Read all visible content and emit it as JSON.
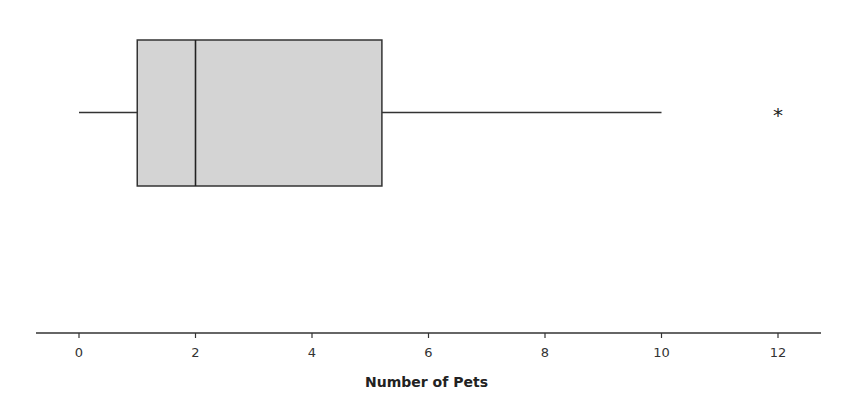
{
  "chart_data": {
    "type": "boxplot",
    "title": "",
    "xlabel": "Number of Pets",
    "ylabel": "",
    "xlim": [
      -0.75,
      12.75
    ],
    "ticks": [
      0,
      2,
      4,
      6,
      8,
      10,
      12
    ],
    "tick_labels": [
      "0",
      "2",
      "4",
      "6",
      "8",
      "10",
      "12"
    ],
    "grid": false,
    "orientation": "horizontal",
    "box": {
      "whisker_low": 0,
      "q1": 1,
      "median": 2,
      "q3": 5.2,
      "whisker_high": 10
    },
    "outliers": [
      12
    ],
    "outlier_marker": "*",
    "colors": {
      "box_fill": "#d4d4d4",
      "stroke": "#333333"
    }
  }
}
